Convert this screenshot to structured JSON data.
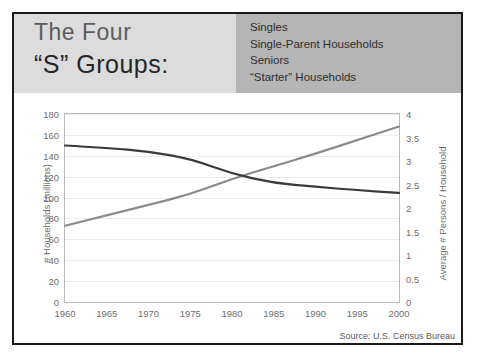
{
  "slide": {
    "title_line1": "The Four",
    "title_line2": "“S” Groups:",
    "legend_items": [
      "Singles",
      "Single-Parent Households",
      "Seniors",
      "“Starter” Households"
    ],
    "source": "Source: U.S. Census Bureau",
    "colors": {
      "title_band": "#dcdcdc",
      "legend_band": "#b5b5b5",
      "households_line": "#8a8a8a",
      "persons_line": "#3a3a3a",
      "frame": "#1a1a1a"
    }
  },
  "chart_data": {
    "type": "line",
    "title": "",
    "xlabel": "",
    "ylabel": "# Households (millions)",
    "y2label": "Average # Persons / Household",
    "x": [
      1960,
      1965,
      1970,
      1975,
      1980,
      1985,
      1990,
      1995,
      2000
    ],
    "xticklabels": [
      "1960",
      "1965",
      "1970",
      "1975",
      "1980",
      "1985",
      "1990",
      "1995",
      "2000"
    ],
    "xlim": [
      1960,
      2000
    ],
    "ylim": [
      0,
      180
    ],
    "yticks": [
      0,
      20,
      40,
      60,
      80,
      100,
      120,
      140,
      160,
      180
    ],
    "yticklabels": [
      "0",
      "20",
      "40",
      "60",
      "80",
      "100",
      "120",
      "140",
      "160",
      "180"
    ],
    "y2lim": [
      0,
      4
    ],
    "y2ticks": [
      0,
      0.5,
      1,
      1.5,
      2,
      2.5,
      3,
      3.5,
      4
    ],
    "y2ticklabels": [
      "0",
      "0.5",
      "1",
      "1.5",
      "2",
      "2.5",
      "3",
      "3.5",
      "4"
    ],
    "grid": true,
    "legend_position": "none",
    "series": [
      {
        "name": "# Households (millions)",
        "axis": "left",
        "color": "#8a8a8a",
        "values": [
          73,
          83,
          93,
          103,
          118,
          130,
          142,
          155,
          168
        ]
      },
      {
        "name": "Average # Persons / Household",
        "axis": "right",
        "color": "#3a3a3a",
        "values": [
          3.33,
          3.28,
          3.2,
          3.05,
          2.73,
          2.53,
          2.45,
          2.38,
          2.32
        ]
      }
    ],
    "annotations": [
      "Source: U.S. Census Bureau"
    ]
  }
}
